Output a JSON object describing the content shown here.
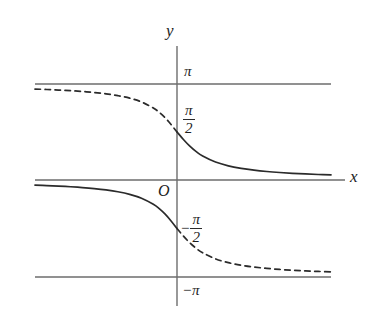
{
  "figure": {
    "title": "",
    "background_color": "#ffffff",
    "axis_color": "#6d6d6d",
    "curve_color": "#2b2b2b",
    "text_color": "#1c1c1c"
  },
  "labels": {
    "y_axis": "y",
    "x_axis": "x",
    "origin": "O",
    "pi_top": "π",
    "pi_bottom_minus": "−π",
    "half_pi_num": "π",
    "half_pi_den": "2",
    "neg_half_pi_sign": "−",
    "neg_half_pi_num": "π",
    "neg_half_pi_den": "2"
  },
  "chart_data": {
    "type": "line",
    "title": "",
    "xlabel": "x",
    "ylabel": "y",
    "xlim": [
      -6,
      6
    ],
    "ylim": [
      -3.14159,
      3.14159
    ],
    "grid": false,
    "legend": null,
    "y_ticks": [
      {
        "value": 3.14159,
        "label": "π"
      },
      {
        "value": 1.5708,
        "label": "π/2"
      },
      {
        "value": 0,
        "label": "O"
      },
      {
        "value": -1.5708,
        "label": "-π/2"
      },
      {
        "value": -3.14159,
        "label": "-π"
      }
    ],
    "asymptote_lines": [
      {
        "y": 3.14159,
        "label": "π",
        "style": "solid"
      },
      {
        "y": 0,
        "label": "x-axis",
        "style": "solid"
      },
      {
        "y": -3.14159,
        "label": "-π",
        "style": "solid"
      }
    ],
    "series": [
      {
        "name": "upper-branch-dashed",
        "style": "dashed",
        "description": "y = arccot(x) for x < 0, approaching pi as x decreases",
        "x": [
          -6.0,
          -5.5,
          -5.0,
          -4.5,
          -4.0,
          -3.5,
          -3.0,
          -2.5,
          -2.0,
          -1.5,
          -1.0,
          -0.75,
          -0.5,
          -0.25,
          0.0
        ],
        "y": [
          2.976,
          2.962,
          2.944,
          2.923,
          2.897,
          2.863,
          2.82,
          2.761,
          2.678,
          2.554,
          2.356,
          2.214,
          2.034,
          1.816,
          1.5708
        ]
      },
      {
        "name": "upper-branch-solid",
        "style": "solid",
        "description": "y = arccot(x) for x > 0, approaching 0 as x increases",
        "x": [
          0.0,
          0.25,
          0.5,
          0.75,
          1.0,
          1.5,
          2.0,
          2.5,
          3.0,
          3.5,
          4.0,
          4.5,
          5.0,
          5.5,
          6.0
        ],
        "y": [
          1.5708,
          1.3258,
          1.1071,
          0.9273,
          0.7854,
          0.588,
          0.4636,
          0.3805,
          0.3217,
          0.2783,
          0.245,
          0.2187,
          0.1974,
          0.1799,
          0.1651
        ]
      },
      {
        "name": "lower-branch-solid",
        "style": "solid",
        "description": "y = arccot(x) - pi for x < 0, approaching 0 from below as x decreases",
        "x": [
          -6.0,
          -5.5,
          -5.0,
          -4.5,
          -4.0,
          -3.5,
          -3.0,
          -2.5,
          -2.0,
          -1.5,
          -1.0,
          -0.75,
          -0.5,
          -0.25,
          0.0
        ],
        "y": [
          -0.1651,
          -0.1799,
          -0.1974,
          -0.2187,
          -0.245,
          -0.2783,
          -0.3217,
          -0.3805,
          -0.4636,
          -0.588,
          -0.7854,
          -0.9273,
          -1.1071,
          -1.3258,
          -1.5708
        ]
      },
      {
        "name": "lower-branch-dashed",
        "style": "dashed",
        "description": "y = arccot(x) - pi for x > 0, approaching -pi as x increases",
        "x": [
          0.0,
          0.25,
          0.5,
          0.75,
          1.0,
          1.5,
          2.0,
          2.5,
          3.0,
          3.5,
          4.0,
          4.5,
          5.0,
          5.5,
          6.0
        ],
        "y": [
          -1.5708,
          -1.8158,
          -2.0344,
          -2.2143,
          -2.3562,
          -2.5536,
          -2.6779,
          -2.7611,
          -2.8198,
          -2.8633,
          -2.8966,
          -2.9229,
          -2.9442,
          -2.9617,
          -2.9765
        ]
      }
    ]
  }
}
